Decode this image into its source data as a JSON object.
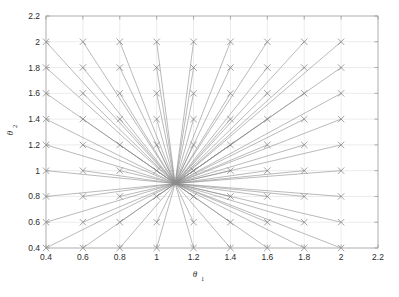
{
  "figure": {
    "background_color": "#ffffff",
    "axes_color": "#9a9a9a",
    "grid_color": "#d8d8d8",
    "line_color": "#8c8c8c",
    "marker_color": "#7a7a7a",
    "text_color": "#2b2b2b"
  },
  "chart_data": {
    "type": "line",
    "title": "",
    "subtitle": "",
    "xlabel": "θ",
    "xlabel_sub": "1",
    "ylabel": "θ",
    "ylabel_sub": "2",
    "xlim": [
      0.4,
      2.2
    ],
    "ylim": [
      0.4,
      2.2
    ],
    "xticks": [
      0.4,
      0.6,
      0.8,
      1,
      1.2,
      1.4,
      1.6,
      1.8,
      2,
      2.2
    ],
    "xticklabels": [
      "0.4",
      "0.6",
      "0.8",
      "1",
      "1.2",
      "1.4",
      "1.6",
      "1.8",
      "2",
      "2.2"
    ],
    "yticks": [
      0.4,
      0.6,
      0.8,
      1,
      1.2,
      1.4,
      1.6,
      1.8,
      2,
      2.2
    ],
    "yticklabels": [
      "0.4",
      "0.6",
      "0.8",
      "1",
      "1.2",
      "1.4",
      "1.6",
      "1.8",
      "2",
      "2.2"
    ],
    "grid": true,
    "legend": null,
    "legend_position": "none",
    "marker": "x",
    "marker_size": 3.2,
    "line_width": 0.6,
    "convergence_point": [
      1.1,
      0.9
    ],
    "start_grid_x": [
      0.4,
      0.6,
      0.8,
      1.0,
      1.2,
      1.4,
      1.6,
      1.8,
      2.0
    ],
    "start_grid_y": [
      0.4,
      0.6,
      0.8,
      1.0,
      1.2,
      1.4,
      1.6,
      1.8,
      2.0
    ],
    "series_note": "81 segments, one per (x,y) grid start point",
    "markers_note": "x markers drawn at every grid start point"
  }
}
